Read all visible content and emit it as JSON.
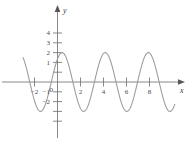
{
  "figure": {
    "title": "",
    "background_color": "#ffffff",
    "axis_color": "#7a7a7a",
    "curve_color": "#9a9a9a",
    "label_color": "#4a4a4a"
  },
  "axes": {
    "x_axis_label": "x",
    "y_axis_label": "y",
    "origin_label": "0",
    "x_ticks": [
      {
        "value": -2,
        "label": "−2"
      },
      {
        "value": 2,
        "label": "2"
      },
      {
        "value": 4,
        "label": "4"
      },
      {
        "value": 6,
        "label": "6"
      },
      {
        "value": 8,
        "label": "8"
      }
    ],
    "y_ticks": [
      {
        "value": 4,
        "label": "4"
      },
      {
        "value": 3,
        "label": "3"
      },
      {
        "value": 2,
        "label": "2"
      },
      {
        "value": 1,
        "label": "1"
      },
      {
        "value": -1,
        "label": "−1"
      },
      {
        "value": -2,
        "label": "−2"
      },
      {
        "value": -3,
        "label": ""
      }
    ]
  },
  "chart_data": {
    "type": "line",
    "title": "",
    "xlabel": "x",
    "ylabel": "y",
    "xlim": [
      -3.0,
      10.2
    ],
    "ylim": [
      -4.0,
      4.6
    ],
    "grid": false,
    "legend": null,
    "series": [
      {
        "name": "sinusoid",
        "function": "y = 3 cos(1.676 (x - 0.40))",
        "amplitude": 3,
        "period": 3.75,
        "phase_peak_x": 0.4,
        "midline": 0,
        "color": "#9a9a9a",
        "maxima_x": [
          -3.35,
          0.4,
          4.15,
          7.9
        ],
        "minima_x": [
          -1.47,
          2.28,
          6.03,
          9.78
        ],
        "x": [
          -3.0,
          -2.8,
          -2.6,
          -2.4,
          -2.2,
          -2.0,
          -1.8,
          -1.6,
          -1.4,
          -1.2,
          -1.0,
          -0.8,
          -0.6,
          -0.4,
          -0.2,
          0.0,
          0.2,
          0.4,
          0.6,
          0.8,
          1.0,
          1.2,
          1.4,
          1.6,
          1.8,
          2.0,
          2.2,
          2.4,
          2.6,
          2.8,
          3.0,
          3.2,
          3.4,
          3.6,
          3.8,
          4.0,
          4.2,
          4.4,
          4.6,
          4.8,
          5.0,
          5.2,
          5.4,
          5.6,
          5.8,
          6.0,
          6.2,
          6.4,
          6.6,
          6.8,
          7.0,
          7.2,
          7.4,
          7.6,
          7.8,
          8.0,
          8.2,
          8.4,
          8.6,
          8.8,
          9.0,
          9.2,
          9.4,
          9.6,
          9.8,
          10.0,
          10.2
        ],
        "y": [
          2.21,
          2.83,
          2.99,
          2.67,
          1.93,
          0.9,
          -0.26,
          -1.36,
          -2.25,
          -2.82,
          -3.0,
          -2.76,
          -2.15,
          -1.24,
          -0.16,
          0.94,
          1.92,
          2.65,
          2.99,
          2.88,
          2.34,
          1.45,
          0.34,
          -0.82,
          -1.84,
          -2.58,
          -2.95,
          -2.9,
          -2.44,
          -1.63,
          -0.57,
          0.57,
          1.63,
          2.44,
          2.9,
          2.95,
          2.58,
          1.84,
          0.82,
          -0.34,
          -1.45,
          -2.34,
          -2.88,
          -2.99,
          -2.65,
          -1.92,
          -0.94,
          0.16,
          1.24,
          2.15,
          2.76,
          3.0,
          2.82,
          2.25,
          1.36,
          0.26,
          -0.9,
          -1.93,
          -2.67,
          -2.99,
          -2.83,
          -2.21,
          -1.26,
          -0.15,
          0.99,
          1.99,
          2.7
        ]
      }
    ]
  }
}
